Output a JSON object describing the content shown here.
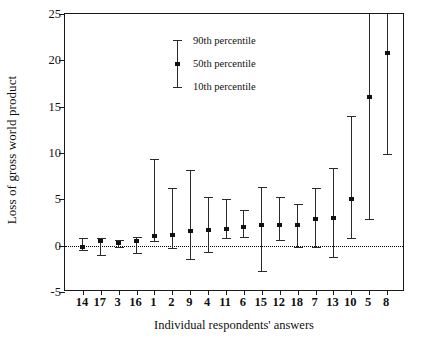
{
  "chart_data": {
    "type": "scatter",
    "title": "",
    "xlabel": "Individual respondents' answers",
    "ylabel": "Loss of gross world product",
    "ylim": [
      -5,
      25
    ],
    "yticks": [
      -5,
      0,
      5,
      10,
      15,
      20,
      25
    ],
    "grid": false,
    "zero_reference_line": 0,
    "legend_position": "top-left inside axes",
    "legend": [
      {
        "key": "p90",
        "label": "90th percentile"
      },
      {
        "key": "p50",
        "label": "50th percentile"
      },
      {
        "key": "p10",
        "label": "10th percentile"
      }
    ],
    "categories": [
      "14",
      "17",
      "3",
      "16",
      "1",
      "2",
      "9",
      "4",
      "11",
      "6",
      "15",
      "12",
      "18",
      "7",
      "13",
      "10",
      "5",
      "8"
    ],
    "series": [
      {
        "name": "10th percentile",
        "values": [
          -0.5,
          -1.0,
          -0.1,
          -0.8,
          0.5,
          -0.3,
          -1.4,
          -0.7,
          0.8,
          0.9,
          -2.7,
          0.6,
          -0.1,
          -0.1,
          -1.2,
          0.8,
          2.9,
          9.9
        ]
      },
      {
        "name": "50th percentile",
        "values": [
          -0.1,
          0.5,
          0.3,
          0.5,
          1.0,
          1.1,
          1.6,
          1.7,
          1.8,
          2.0,
          2.2,
          2.2,
          2.2,
          2.9,
          3.0,
          5.0,
          16.0,
          20.8
        ]
      },
      {
        "name": "90th percentile",
        "values": [
          0.8,
          0.8,
          0.6,
          0.9,
          9.3,
          6.2,
          8.2,
          5.2,
          5.0,
          3.9,
          6.3,
          5.2,
          4.5,
          6.2,
          8.4,
          14.0,
          25.0,
          25.0
        ]
      }
    ],
    "clipped_at_top": [
      "5",
      "8"
    ],
    "colors": {
      "marker": "#111111",
      "whisker": "#2a2a2a",
      "axis": "#1a1a1a",
      "zero_line": "#000000"
    }
  }
}
